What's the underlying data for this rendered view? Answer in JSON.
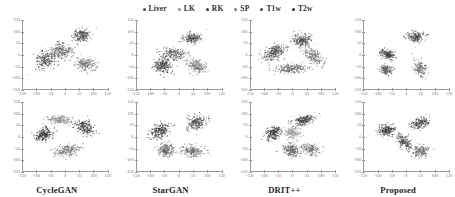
{
  "figure": {
    "title": "",
    "background": "#ffffff"
  },
  "legend": {
    "position": "top-center",
    "items": [
      {
        "label": "Liver",
        "color": "#4a4a4a",
        "marker": "dot"
      },
      {
        "label": "LK",
        "color": "#8c8c8c",
        "marker": "dot"
      },
      {
        "label": "RK",
        "color": "#3f3f3f",
        "marker": "dot"
      },
      {
        "label": "SP",
        "color": "#7a7a7a",
        "marker": "dot"
      },
      {
        "label": "T1w",
        "color": "#454545",
        "marker": "dot"
      },
      {
        "label": "T2w",
        "color": "#2e2e2e",
        "marker": "dot"
      }
    ]
  },
  "axes": {
    "xticks": [
      -150,
      -100,
      -50,
      0,
      50,
      100,
      150
    ],
    "yticks": [
      150,
      100,
      50,
      0,
      -50,
      -100,
      -150
    ],
    "xlim": [
      -150,
      150
    ],
    "ylim": [
      -150,
      150
    ],
    "xlabel": "",
    "ylabel": "",
    "grid": false
  },
  "panels": [
    {
      "title": "CycleGAN",
      "row": 1,
      "col": 1
    },
    {
      "title": "StarGAN",
      "row": 1,
      "col": 2
    },
    {
      "title": "DRIT++",
      "row": 1,
      "col": 3
    },
    {
      "title": "Proposed",
      "row": 1,
      "col": 4
    },
    {
      "title": "CycleGAN",
      "row": 2,
      "col": 1
    },
    {
      "title": "StarGAN",
      "row": 2,
      "col": 2
    },
    {
      "title": "DRIT++",
      "row": 2,
      "col": 3
    },
    {
      "title": "Proposed",
      "row": 2,
      "col": 4
    }
  ],
  "chart_data": {
    "type": "scatter",
    "title": "",
    "xlabel": "",
    "ylabel": "",
    "xlim": [
      -150,
      150
    ],
    "ylim": [
      -150,
      150
    ],
    "grid": false,
    "legend_position": "top-center",
    "classes": [
      "Liver",
      "LK",
      "RK",
      "SP",
      "T1w",
      "T2w"
    ],
    "class_colors": [
      "#4a4a4a",
      "#8c8c8c",
      "#3f3f3f",
      "#7a7a7a",
      "#454545",
      "#2e2e2e"
    ],
    "panel_titles": [
      "CycleGAN",
      "StarGAN",
      "DRIT++",
      "Proposed"
    ],
    "rows": 2,
    "cols": 4,
    "panels": [
      {
        "title": "CycleGAN",
        "row": 1,
        "clusters": [
          {
            "class": "Liver",
            "center": [
              -62,
              -18
            ],
            "spread": [
              30,
              46
            ],
            "angle": -35,
            "n": 260,
            "color": "#3b3b3b"
          },
          {
            "class": "LK",
            "center": [
              -8,
              18
            ],
            "spread": [
              34,
              28
            ],
            "angle": -22,
            "n": 240,
            "color": "#5e5e5e"
          },
          {
            "class": "RK",
            "center": [
              58,
              84
            ],
            "spread": [
              28,
              24
            ],
            "angle": 10,
            "n": 230,
            "color": "#4a4a4a"
          },
          {
            "class": "SP",
            "center": [
              74,
              -40
            ],
            "spread": [
              34,
              24
            ],
            "angle": -30,
            "n": 230,
            "color": "#6d6d6d"
          }
        ]
      },
      {
        "title": "StarGAN",
        "row": 1,
        "clusters": [
          {
            "class": "Liver",
            "center": [
              -56,
              -44
            ],
            "spread": [
              30,
              26
            ],
            "angle": -18,
            "n": 250,
            "color": "#3d3d3d"
          },
          {
            "class": "LK",
            "center": [
              -16,
              6
            ],
            "spread": [
              40,
              22
            ],
            "angle": -5,
            "n": 250,
            "color": "#5a5a5a"
          },
          {
            "class": "RK",
            "center": [
              46,
              72
            ],
            "spread": [
              30,
              22
            ],
            "angle": 5,
            "n": 230,
            "color": "#4d4d4d"
          },
          {
            "class": "SP",
            "center": [
              62,
              -48
            ],
            "spread": [
              34,
              24
            ],
            "angle": -32,
            "n": 230,
            "color": "#707070"
          }
        ]
      },
      {
        "title": "DRIT++",
        "row": 1,
        "clusters": [
          {
            "class": "Liver",
            "center": [
              -66,
              12
            ],
            "spread": [
              26,
              40
            ],
            "angle": -50,
            "n": 260,
            "color": "#3a3a3a"
          },
          {
            "class": "LK",
            "center": [
              -10,
              -58
            ],
            "spread": [
              52,
              18
            ],
            "angle": 6,
            "n": 260,
            "color": "#606060"
          },
          {
            "class": "RK",
            "center": [
              34,
              66
            ],
            "spread": [
              30,
              26
            ],
            "angle": 14,
            "n": 240,
            "color": "#4b4b4b"
          },
          {
            "class": "SP",
            "center": [
              72,
              -6
            ],
            "spread": [
              22,
              42
            ],
            "angle": 38,
            "n": 230,
            "color": "#6e6e6e"
          }
        ]
      },
      {
        "title": "Proposed",
        "row": 1,
        "clusters": [
          {
            "class": "Liver",
            "center": [
              -62,
              2
            ],
            "spread": [
              26,
              18
            ],
            "angle": -36,
            "n": 210,
            "color": "#3c3c3c"
          },
          {
            "class": "LK",
            "center": [
              -70,
              -62
            ],
            "spread": [
              20,
              18
            ],
            "angle": -28,
            "n": 190,
            "color": "#5c5c5c"
          },
          {
            "class": "RK",
            "center": [
              36,
              78
            ],
            "spread": [
              28,
              22
            ],
            "angle": 8,
            "n": 210,
            "color": "#4a4a4a"
          },
          {
            "class": "SP",
            "center": [
              52,
              -58
            ],
            "spread": [
              20,
              32
            ],
            "angle": 26,
            "n": 200,
            "color": "#6b6b6b"
          }
        ]
      },
      {
        "title": "CycleGAN",
        "row": 2,
        "clusters": [
          {
            "class": "Liver",
            "center": [
              -74,
              10
            ],
            "spread": [
              22,
              30
            ],
            "angle": -55,
            "n": 230,
            "color": "#333333"
          },
          {
            "class": "LK",
            "center": [
              -18,
              74
            ],
            "spread": [
              40,
              16
            ],
            "angle": -4,
            "n": 220,
            "color": "#8a8a8a"
          },
          {
            "class": "RK",
            "center": [
              70,
              40
            ],
            "spread": [
              24,
              34
            ],
            "angle": 42,
            "n": 230,
            "color": "#3f3f3f"
          },
          {
            "class": "SP",
            "center": [
              6,
              -58
            ],
            "spread": [
              44,
              22
            ],
            "angle": 16,
            "n": 240,
            "color": "#6a6a6a"
          }
        ]
      },
      {
        "title": "StarGAN",
        "row": 2,
        "clusters": [
          {
            "class": "Liver",
            "center": [
              -66,
              28
            ],
            "spread": [
              24,
              34
            ],
            "angle": -48,
            "n": 240,
            "color": "#343434"
          },
          {
            "class": "LK",
            "center": [
              -44,
              -54
            ],
            "spread": [
              26,
              26
            ],
            "angle": -18,
            "n": 220,
            "color": "#5f5f5f"
          },
          {
            "class": "RK",
            "center": [
              62,
              62
            ],
            "spread": [
              32,
              24
            ],
            "angle": 26,
            "n": 230,
            "color": "#3d3d3d"
          },
          {
            "class": "SP",
            "center": [
              48,
              -62
            ],
            "spread": [
              36,
              22
            ],
            "angle": -12,
            "n": 230,
            "color": "#6c6c6c"
          }
        ]
      },
      {
        "title": "DRIT++",
        "row": 2,
        "clusters": [
          {
            "class": "Liver",
            "center": [
              -68,
              16
            ],
            "spread": [
              22,
              30
            ],
            "angle": -44,
            "n": 230,
            "color": "#343434"
          },
          {
            "class": "LK",
            "center": [
              0,
              18
            ],
            "spread": [
              26,
              22
            ],
            "angle": 0,
            "n": 200,
            "color": "#9a9a9a"
          },
          {
            "class": "RK",
            "center": [
              40,
              72
            ],
            "spread": [
              36,
              18
            ],
            "angle": 18,
            "n": 230,
            "color": "#3c3c3c"
          },
          {
            "class": "SP",
            "center": [
              -6,
              -56
            ],
            "spread": [
              24,
              30
            ],
            "angle": 34,
            "n": 230,
            "color": "#5a5a5a"
          },
          {
            "class": "SP",
            "center": [
              62,
              -52
            ],
            "spread": [
              28,
              22
            ],
            "angle": -10,
            "n": 200,
            "color": "#6c6c6c"
          }
        ]
      },
      {
        "title": "Proposed",
        "row": 2,
        "clusters": [
          {
            "class": "Liver",
            "center": [
              -66,
              28
            ],
            "spread": [
              22,
              26
            ],
            "angle": -42,
            "n": 210,
            "color": "#343434"
          },
          {
            "class": "LK",
            "center": [
              -6,
              -22
            ],
            "spread": [
              18,
              34
            ],
            "angle": 30,
            "n": 210,
            "color": "#4e4e4e"
          },
          {
            "class": "RK",
            "center": [
              52,
              60
            ],
            "spread": [
              30,
              20
            ],
            "angle": 22,
            "n": 200,
            "color": "#3a3a3a"
          },
          {
            "class": "SP",
            "center": [
              52,
              -62
            ],
            "spread": [
              26,
              22
            ],
            "angle": -8,
            "n": 200,
            "color": "#666666"
          }
        ]
      }
    ]
  }
}
